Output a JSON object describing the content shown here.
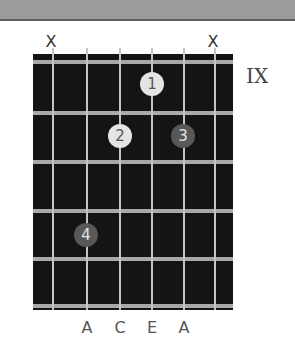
{
  "diagram": {
    "type": "guitar-chord-chart",
    "fret_position": "IX",
    "strings": 6,
    "muted_labels": [
      {
        "string": 1,
        "label": "X"
      },
      {
        "string": 6,
        "label": "X"
      }
    ],
    "fingers": [
      {
        "label": "1",
        "string": 4,
        "fret": 1,
        "style": "light"
      },
      {
        "label": "2",
        "string": 3,
        "fret": 2,
        "style": "light"
      },
      {
        "label": "3",
        "string": 5,
        "fret": 2,
        "style": "dark"
      },
      {
        "label": "4",
        "string": 2,
        "fret": 4,
        "style": "dark"
      }
    ],
    "note_labels": [
      {
        "string": 2,
        "label": "A"
      },
      {
        "string": 3,
        "label": "C"
      },
      {
        "string": 4,
        "label": "E"
      },
      {
        "string": 5,
        "label": "A"
      }
    ]
  },
  "colors": {
    "fretboard": "#141414",
    "fret_wire": "#a9a9a9",
    "string": "#c4c4c4",
    "dot_light": "#e4e4e4",
    "dot_dark": "#585858",
    "top_bar": "#9c9c9c"
  }
}
